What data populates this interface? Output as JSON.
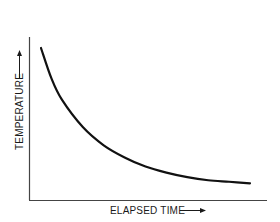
{
  "chart_data": {
    "type": "line",
    "title": "",
    "xlabel": "ELAPSED TIME",
    "ylabel": "TEMPERATURE",
    "x_ticks": [],
    "y_ticks": [],
    "grid": false,
    "legend": null,
    "series": [
      {
        "name": "temperature",
        "description": "Exponential decay of temperature over elapsed time, approaching an asymptote",
        "x": [
          0.0,
          0.05,
          0.1,
          0.2,
          0.3,
          0.4,
          0.5,
          0.6,
          0.7,
          0.8,
          0.9,
          1.0
        ],
        "values": [
          1.0,
          0.8,
          0.66,
          0.48,
          0.36,
          0.28,
          0.22,
          0.18,
          0.15,
          0.13,
          0.12,
          0.11
        ]
      }
    ],
    "axis_ranges": {
      "x": [
        0,
        1
      ],
      "y": [
        0,
        1
      ]
    },
    "color": "#111111"
  },
  "axes": {
    "x_label": "ELAPSED TIME",
    "y_label": "TEMPERATURE"
  }
}
